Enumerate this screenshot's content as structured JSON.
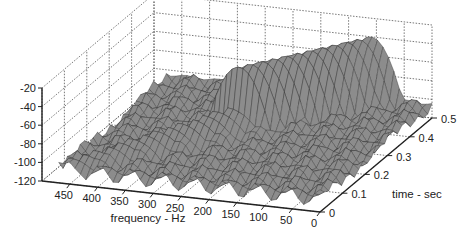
{
  "chart_data": {
    "type": "surface3d",
    "title": "",
    "xlabel": "frequency - Hz",
    "ylabel": "time - sec",
    "zlabel": "",
    "x_ticks": [
      "450",
      "400",
      "350",
      "300",
      "250",
      "200",
      "150",
      "100",
      "50",
      "0"
    ],
    "y_ticks": [
      "0",
      "0.1",
      "0.2",
      "0.3",
      "0.4",
      "0.5"
    ],
    "z_ticks": [
      "-20",
      "-40",
      "-60",
      "-80",
      "-100",
      "-120"
    ],
    "xlim": [
      0,
      500
    ],
    "ylim": [
      0,
      0.5
    ],
    "zlim": [
      -120,
      -20
    ],
    "grid": true,
    "surface_color": "#8c8c8c",
    "edge_color": "#333333",
    "ridge": [
      {
        "freq": 460,
        "time": 0.0,
        "level": -100
      },
      {
        "freq": 400,
        "time": 0.05,
        "level": -95
      },
      {
        "freq": 350,
        "time": 0.1,
        "level": -92
      },
      {
        "freq": 300,
        "time": 0.15,
        "level": -90
      },
      {
        "freq": 250,
        "time": 0.2,
        "level": -85
      },
      {
        "freq": 200,
        "time": 0.25,
        "level": -80
      },
      {
        "freq": 150,
        "time": 0.3,
        "level": -45
      },
      {
        "freq": 120,
        "time": 0.4,
        "level": -40
      },
      {
        "freq": 100,
        "time": 0.5,
        "level": -40
      }
    ]
  }
}
